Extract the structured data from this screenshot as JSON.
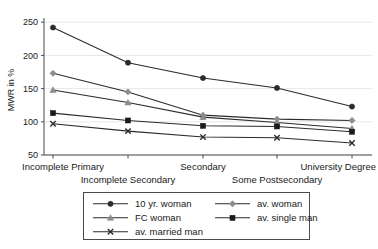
{
  "chart_data": {
    "type": "line",
    "title": "",
    "xlabel": "",
    "ylabel": "MWR in %",
    "categories": [
      "Incomplete Primary",
      "Incomplete Secondary",
      "Secondary",
      "Some Postsecondary",
      "University Degree"
    ],
    "yticks": [
      50,
      100,
      150,
      200,
      250
    ],
    "ylim": [
      40,
      260
    ],
    "grid": true,
    "legend_position": "bottom",
    "series": [
      {
        "name": "10 yr. woman",
        "marker": "circle",
        "color": "#2b2b2b",
        "values": [
          242,
          189,
          166,
          151,
          123
        ]
      },
      {
        "name": "av. woman",
        "marker": "diamond",
        "color": "#8c8c8c",
        "values": [
          173,
          145,
          110,
          104,
          102
        ]
      },
      {
        "name": "FC woman",
        "marker": "triangle",
        "color": "#8c8c8c",
        "values": [
          148,
          129,
          107,
          99,
          90
        ]
      },
      {
        "name": "av. single man",
        "marker": "square",
        "color": "#1a1a1a",
        "values": [
          113,
          102,
          94,
          93,
          85
        ]
      },
      {
        "name": "av. married man",
        "marker": "x",
        "color": "#2b2b2b",
        "values": [
          97,
          86,
          77,
          76,
          68
        ]
      }
    ]
  },
  "legend": {
    "entries": [
      {
        "label": "10 yr. woman"
      },
      {
        "label": "av. woman"
      },
      {
        "label": "FC woman"
      },
      {
        "label": "av. single man"
      },
      {
        "label": "av. married man"
      }
    ]
  }
}
